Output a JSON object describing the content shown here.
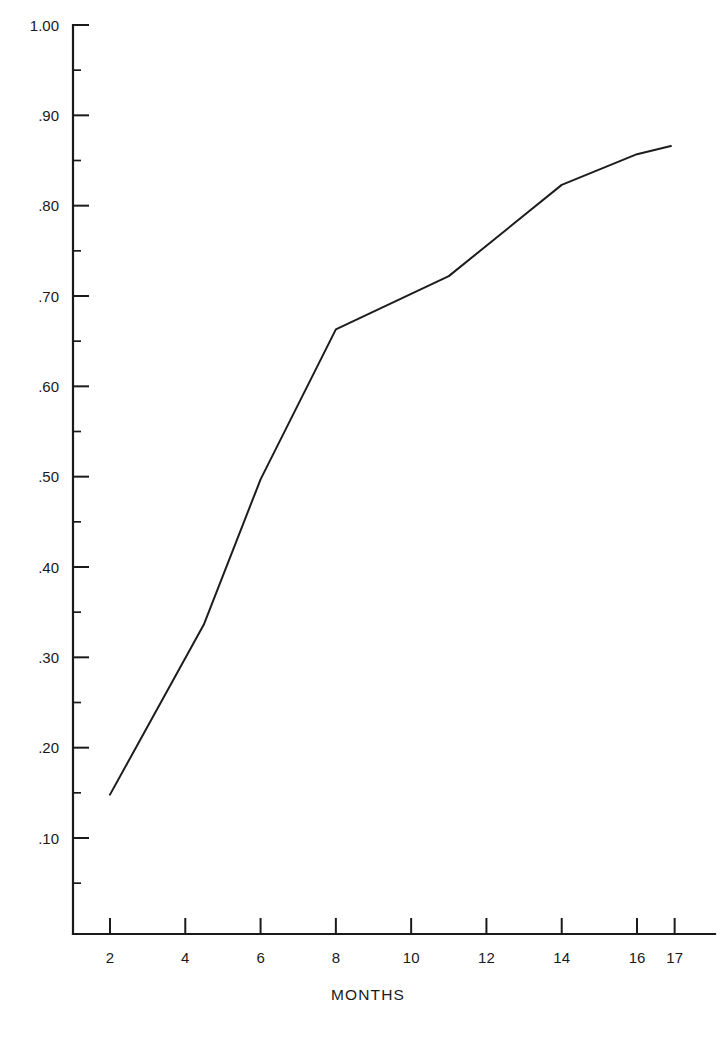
{
  "chart_data": {
    "type": "line",
    "title": "",
    "subtitle": "",
    "xlabel": "MONTHS",
    "ylabel": "",
    "xlim": [
      1.0,
      17.6
    ],
    "ylim": [
      0.0,
      1.0
    ],
    "grid": false,
    "legend": null,
    "x_ticks": [
      2,
      4,
      6,
      8,
      10,
      12,
      14,
      16,
      17
    ],
    "x_tick_labels": [
      "2",
      "4",
      "6",
      "8",
      "10",
      "12",
      "14",
      "16",
      "17"
    ],
    "y_ticks": [
      0.1,
      0.2,
      0.3,
      0.4,
      0.5,
      0.6,
      0.7,
      0.8,
      0.9,
      1.0
    ],
    "y_tick_labels": [
      ".10",
      ".20",
      ".30",
      ".40",
      ".50",
      ".60",
      ".70",
      ".80",
      ".90",
      "1.00"
    ],
    "y_minor_ticks": [
      0.05,
      0.15,
      0.25,
      0.35,
      0.45,
      0.55,
      0.65,
      0.75,
      0.85,
      0.95
    ],
    "series": [
      {
        "name": "cumulative",
        "color": "#1d1d1d",
        "points": [
          {
            "x": 2.0,
            "y": 0.148
          },
          {
            "x": 4.5,
            "y": 0.337
          },
          {
            "x": 6.0,
            "y": 0.497
          },
          {
            "x": 8.0,
            "y": 0.663
          },
          {
            "x": 11.0,
            "y": 0.722
          },
          {
            "x": 14.0,
            "y": 0.823
          },
          {
            "x": 16.0,
            "y": 0.857
          },
          {
            "x": 16.9,
            "y": 0.866
          }
        ]
      }
    ]
  },
  "axis_titles": {
    "x": "MONTHS"
  }
}
